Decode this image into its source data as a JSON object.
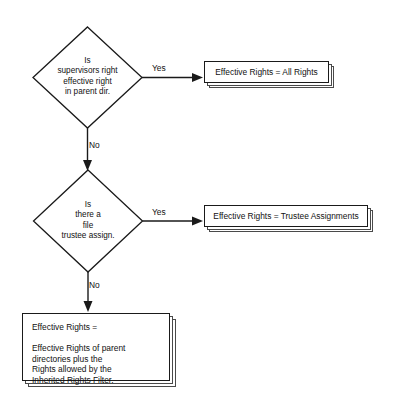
{
  "diagram": {
    "colors": {
      "background": "#ffffff",
      "stroke": "#1a1a1a",
      "shadow_stroke": "#4a4a4a",
      "text": "#111111"
    },
    "decisions": [
      {
        "id": "supervisor-right",
        "text": "Is\nsupervisors right\neffective right\nin parent dir.",
        "yes_label": "Yes",
        "no_label": "No"
      },
      {
        "id": "file-trustee",
        "text": "Is\nthere a\nfile\ntrustee assign.",
        "yes_label": "Yes",
        "no_label": "No"
      }
    ],
    "results": [
      {
        "id": "all-rights",
        "text": "Effective Rights = All Rights"
      },
      {
        "id": "trustee-assignments",
        "text": "Effective Rights = Trustee Assignments"
      },
      {
        "id": "inherited-rights",
        "text": "Effective Rights =\n\nEffective Rights of parent\ndirectories plus the\nRights allowed by the\nInherited Rights Filter."
      }
    ]
  }
}
